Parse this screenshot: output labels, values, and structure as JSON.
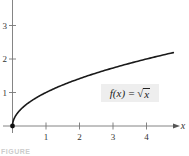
{
  "chart_data": {
    "type": "line",
    "title": "",
    "function_label": "f(x) = √x",
    "xlabel": "x",
    "ylabel": "",
    "xlim": [
      0,
      5
    ],
    "ylim": [
      0,
      3.6
    ],
    "x_ticks": [
      1,
      2,
      3,
      4
    ],
    "y_ticks": [
      1,
      2,
      3
    ],
    "x_tick_labels": [
      "1",
      "2",
      "3",
      "4"
    ],
    "y_tick_labels": [
      "1",
      "2",
      "3"
    ],
    "grid": false,
    "legend": "none",
    "series": [
      {
        "name": "f(x) = √x",
        "x": [
          0,
          0.05,
          0.1,
          0.25,
          0.5,
          0.75,
          1,
          1.5,
          2,
          2.5,
          3,
          3.5,
          4,
          4.5,
          4.8
        ],
        "values": [
          0,
          0.224,
          0.316,
          0.5,
          0.707,
          0.866,
          1,
          1.225,
          1.414,
          1.581,
          1.732,
          1.871,
          2,
          2.121,
          2.191
        ]
      }
    ],
    "annotations": [
      {
        "type": "point",
        "x": 0,
        "y": 0,
        "style": "filled-dot"
      },
      {
        "type": "label-box",
        "text": "f(x) = √x",
        "position": "right-middle"
      }
    ],
    "colors": {
      "curve": "#1a1a1a",
      "axes": "#555555",
      "label_box": "#eeeeee"
    }
  },
  "labels": {
    "x_axis_var": "x",
    "func_prefix": "f(x) = ",
    "func_radicand": "x",
    "caption": "FIGURE"
  }
}
